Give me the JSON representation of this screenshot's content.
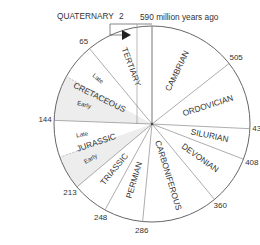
{
  "diagram": {
    "title_annotation": "590 million years ago",
    "total_years": 590,
    "center": [
      152,
      124
    ],
    "radius": 98,
    "colors": {
      "line": "#555555",
      "text": "#333333",
      "shade": "#ededed"
    },
    "boundaries": [
      {
        "age": 2,
        "label": "2"
      },
      {
        "age": 65,
        "label": "65"
      },
      {
        "age": 144,
        "label": "144"
      },
      {
        "age": 213,
        "label": "213"
      },
      {
        "age": 248,
        "label": "248"
      },
      {
        "age": 286,
        "label": "286"
      },
      {
        "age": 360,
        "label": "360"
      },
      {
        "age": 408,
        "label": "408"
      },
      {
        "age": 438,
        "label": "438"
      },
      {
        "age": 505,
        "label": "505"
      },
      {
        "age": 590,
        "label": "590 million years ago"
      }
    ],
    "sub_boundaries": [
      {
        "age": 100
      },
      {
        "age": 180
      }
    ],
    "periods": [
      {
        "name": "QUATERNARY",
        "start": 0,
        "end": 2
      },
      {
        "name": "TERTIARY",
        "start": 2,
        "end": 65
      },
      {
        "name": "CRETACEOUS",
        "start": 65,
        "end": 144,
        "subdivisions": [
          {
            "name": "Late",
            "start": 65,
            "end": 100
          },
          {
            "name": "Early",
            "start": 100,
            "end": 144
          }
        ]
      },
      {
        "name": "JURASSIC",
        "start": 144,
        "end": 213,
        "subdivisions": [
          {
            "name": "Late",
            "start": 144,
            "end": 180
          },
          {
            "name": "Early",
            "start": 180,
            "end": 213
          }
        ]
      },
      {
        "name": "TRIASSIC",
        "start": 213,
        "end": 248
      },
      {
        "name": "PERMIAN",
        "start": 248,
        "end": 286
      },
      {
        "name": "CARBONIFEROUS",
        "start": 286,
        "end": 360
      },
      {
        "name": "DEVONIAN",
        "start": 360,
        "end": 408
      },
      {
        "name": "SILURIAN",
        "start": 408,
        "end": 438
      },
      {
        "name": "ORDOVICIAN",
        "start": 438,
        "end": 505
      },
      {
        "name": "CAMBRIAN",
        "start": 505,
        "end": 590
      }
    ]
  }
}
